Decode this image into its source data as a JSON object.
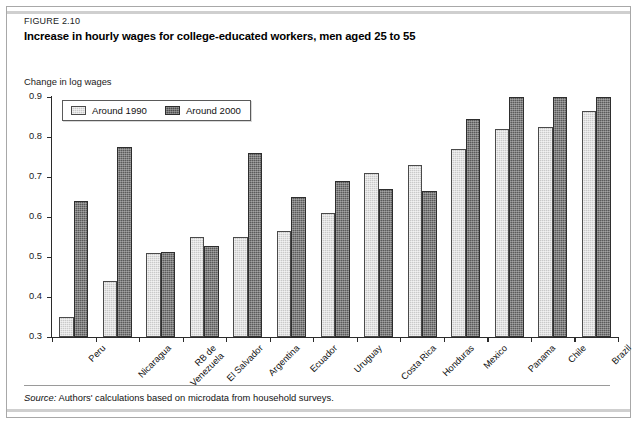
{
  "figure": {
    "number_label": "FIGURE 2.10",
    "title": "Increase in hourly wages for college-educated workers, men aged 25 to 55",
    "source_prefix": "Source:",
    "source_text": "Authors' calculations based on microdata from household surveys."
  },
  "legend": {
    "position": "top-left-inside",
    "entries": [
      {
        "label": "Around 1990",
        "swatch": "light-hatched-swatch",
        "color": "#c9c9c9"
      },
      {
        "label": "Around 2000",
        "swatch": "dark-hatched-swatch",
        "color": "#5a5a5a"
      }
    ]
  },
  "chart_data": {
    "type": "bar",
    "title": "Increase in hourly wages for college-educated workers, men aged 25 to 55",
    "subtitle": "",
    "xlabel": "",
    "ylabel": "Change in log wages",
    "ylim": [
      0.3,
      0.9
    ],
    "yticks": [
      0.3,
      0.4,
      0.5,
      0.6,
      0.7,
      0.8,
      0.9
    ],
    "ytick_labels": [
      "0.3",
      "0.4",
      "0.5",
      "0.6",
      "0.7",
      "0.8",
      "0.9"
    ],
    "grid": false,
    "legend_position": "upper left",
    "categories": [
      "Peru",
      "Nicaragua",
      "RB de\nVenezuela",
      "El Salvador",
      "Argentina",
      "Ecuador",
      "Uruguay",
      "Costa Rica",
      "Honduras",
      "Mexico",
      "Panama",
      "Chile",
      "Brazil"
    ],
    "series": [
      {
        "name": "Around 1990",
        "color": "#c9c9c9",
        "values": [
          0.35,
          0.44,
          0.51,
          0.55,
          0.55,
          0.565,
          0.61,
          0.71,
          0.73,
          0.77,
          0.82,
          0.825,
          0.865
        ]
      },
      {
        "name": "Around 2000",
        "color": "#5a5a5a",
        "values": [
          0.64,
          0.775,
          0.512,
          0.528,
          0.76,
          0.65,
          0.69,
          0.67,
          0.665,
          0.845,
          0.9,
          0.9,
          0.9
        ]
      }
    ]
  }
}
